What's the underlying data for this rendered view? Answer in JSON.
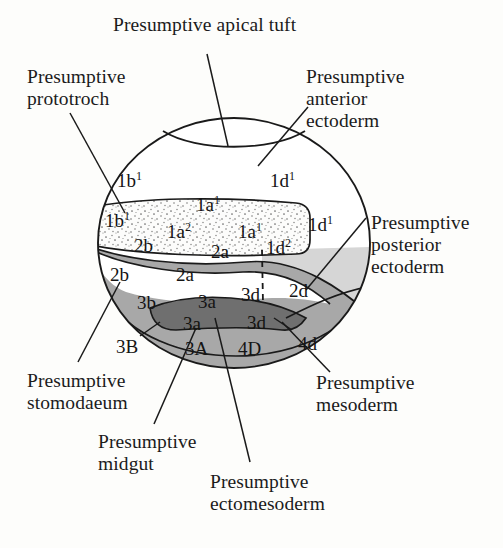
{
  "figure": {
    "type": "fate-map-diagram",
    "background_color": "#fdfdfb",
    "ink_color": "#1a1a1a"
  },
  "region_colors": {
    "white": "#ffffff",
    "stipple_band": "#fbfbfa",
    "light_gray": "#d6d6d6",
    "medium_gray": "#a8a8a8",
    "dark_gray": "#6f6f6f"
  },
  "callouts": [
    {
      "id": "apical-tuft",
      "text": "Presumptive apical tuft",
      "x": 113,
      "y": 14,
      "align": "left"
    },
    {
      "id": "prototroch",
      "text": "Presumptive\nprototroch",
      "x": 27,
      "y": 66,
      "align": "left"
    },
    {
      "id": "anterior-ectoderm",
      "text": "Presumptive\nanterior\nectoderm",
      "x": 306,
      "y": 66,
      "align": "left"
    },
    {
      "id": "posterior-ectoderm",
      "text": "Presumptive\nposterior\nectoderm",
      "x": 371,
      "y": 212,
      "align": "left"
    },
    {
      "id": "mesoderm",
      "text": "Presumptive\nmesoderm",
      "x": 316,
      "y": 372,
      "align": "left"
    },
    {
      "id": "stomodaeum",
      "text": "Presumptive\nstomodaeum",
      "x": 27,
      "y": 370,
      "align": "left"
    },
    {
      "id": "midgut",
      "text": "Presumptive\nmidgut",
      "x": 98,
      "y": 431,
      "align": "left"
    },
    {
      "id": "ectomesoderm",
      "text": "Presumptive\nectomesoderm",
      "x": 210,
      "y": 471,
      "align": "left"
    }
  ],
  "cells": [
    {
      "id": "c-1b1-upper",
      "label": "1b",
      "sup": "1",
      "x": 117,
      "y": 171,
      "zone": "white"
    },
    {
      "id": "c-1d1-upper",
      "label": "1d",
      "sup": "1",
      "x": 270,
      "y": 171,
      "zone": "white"
    },
    {
      "id": "c-1a1-upper",
      "label": "1a",
      "sup": "1",
      "x": 196,
      "y": 195,
      "zone": "white"
    },
    {
      "id": "c-1b1-band",
      "label": "1b",
      "sup": "1",
      "x": 105,
      "y": 211,
      "zone": "stipple"
    },
    {
      "id": "c-1a2-band",
      "label": "1a",
      "sup": "2",
      "x": 167,
      "y": 222,
      "zone": "stipple"
    },
    {
      "id": "c-1a1-band",
      "label": "1a",
      "sup": "1",
      "x": 238,
      "y": 222,
      "zone": "stipple"
    },
    {
      "id": "c-1d1-band",
      "label": "1d",
      "sup": "1",
      "x": 308,
      "y": 215,
      "zone": "white"
    },
    {
      "id": "c-2b-band",
      "label": "2b",
      "sup": "",
      "x": 134,
      "y": 236,
      "zone": "stipple"
    },
    {
      "id": "c-2a-band",
      "label": "2a",
      "sup": "",
      "x": 211,
      "y": 242,
      "zone": "stipple"
    },
    {
      "id": "c-1d2-band",
      "label": "1d",
      "sup": "2",
      "x": 266,
      "y": 238,
      "zone": "stipple"
    },
    {
      "id": "c-2b-gray",
      "label": "2b",
      "sup": "",
      "x": 110,
      "y": 265,
      "zone": "medium"
    },
    {
      "id": "c-2a-white",
      "label": "2a",
      "sup": "",
      "x": 176,
      "y": 265,
      "zone": "white"
    },
    {
      "id": "c-3d-white",
      "label": "3d",
      "sup": "",
      "x": 241,
      "y": 285,
      "zone": "white"
    },
    {
      "id": "c-2d-light",
      "label": "2d",
      "sup": "",
      "x": 289,
      "y": 281,
      "zone": "light"
    },
    {
      "id": "c-3b-gray",
      "label": "3b",
      "sup": "",
      "x": 137,
      "y": 293,
      "zone": "medium"
    },
    {
      "id": "c-3a-gray",
      "label": "3a",
      "sup": "",
      "x": 198,
      "y": 292,
      "zone": "medium"
    },
    {
      "id": "c-3a-dark",
      "label": "3a",
      "sup": "",
      "x": 183,
      "y": 314,
      "zone": "dark"
    },
    {
      "id": "c-3d-dark",
      "label": "3d",
      "sup": "",
      "x": 247,
      "y": 313,
      "zone": "dark"
    },
    {
      "id": "c-3B",
      "label": "3B",
      "sup": "",
      "x": 116,
      "y": 337,
      "zone": "white"
    },
    {
      "id": "c-3A",
      "label": "3A",
      "sup": "",
      "x": 185,
      "y": 339,
      "zone": "medium"
    },
    {
      "id": "c-4D",
      "label": "4D",
      "sup": "",
      "x": 238,
      "y": 339,
      "zone": "medium"
    },
    {
      "id": "c-4d",
      "label": "4d",
      "sup": "",
      "x": 298,
      "y": 334,
      "zone": "white"
    }
  ]
}
